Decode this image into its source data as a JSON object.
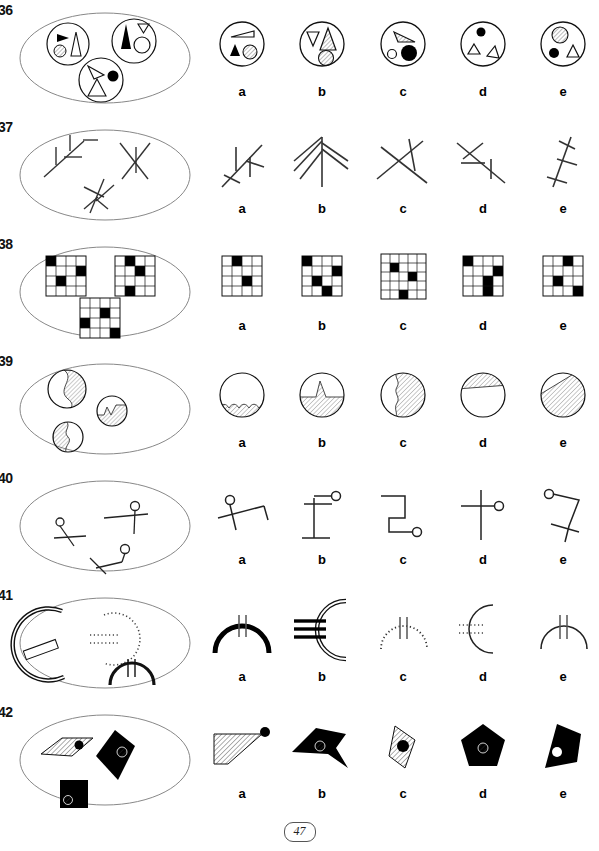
{
  "document": {
    "type": "visual-analogy-puzzle-worksheet",
    "page_number": "47",
    "answer_labels": [
      "a",
      "b",
      "c",
      "d",
      "e"
    ]
  },
  "rows": [
    {
      "number": "36",
      "theme": "circles containing triangles, dots and hatched circles",
      "stem_description": "Oval containing three small circles: (1) black right-pointing triangle, small hatched circle, outlined tall triangle; (2) large black triangle, small outlined down-triangle, outlined circle; (3) outlined slim triangle, black dot, outlined triangle",
      "options": [
        {
          "label": "a",
          "description": "circle with outlined wedge triangle, black triangle and hatched circle"
        },
        {
          "label": "b",
          "description": "circle with outlined down-triangle, hatched tall triangle and hatched circle"
        },
        {
          "label": "c",
          "description": "circle with hatched wedge triangle, small open circle and large black dot"
        },
        {
          "label": "d",
          "description": "circle with black dot and two outlined triangles"
        },
        {
          "label": "e",
          "description": "circle with hatched circle, black dot and outlined triangle"
        }
      ]
    },
    {
      "number": "37",
      "theme": "branching stick figures / arrow-like line clusters",
      "stem_description": "Oval containing three branching line figures resembling arrows and crossed sticks",
      "options": [
        {
          "label": "a",
          "description": "diagonal stem with two upward branches, arrow-like"
        },
        {
          "label": "b",
          "description": "fan of four lines radiating from a single apex, fir-tree like"
        },
        {
          "label": "c",
          "description": "two long lines crossing in an X with a short cross bar"
        },
        {
          "label": "d",
          "description": "diagonal stem with two short left-pointing branches"
        },
        {
          "label": "e",
          "description": "near-vertical stem with three short cross bars"
        }
      ]
    },
    {
      "number": "38",
      "theme": "4x4 grids with black filled cells",
      "stem_description": "Oval containing three 4x4 grids each with three black cells",
      "grid_size": 4,
      "options": [
        {
          "label": "a",
          "filled_cells": [
            [
              0,
              1
            ],
            [
              2,
              2
            ]
          ],
          "description": "4x4 grid, black at row1-col2 and row3-col3"
        },
        {
          "label": "b",
          "filled_cells": [
            [
              0,
              0
            ],
            [
              1,
              3
            ],
            [
              2,
              1
            ],
            [
              3,
              2
            ]
          ],
          "description": "4x4 grid, four black cells in stair pattern"
        },
        {
          "label": "c",
          "filled_cells": [
            [
              1,
              1
            ],
            [
              2,
              2
            ],
            [
              3,
              2
            ]
          ],
          "description": "5x4 grid, black cells in diagonal pattern"
        },
        {
          "label": "d",
          "filled_cells": [
            [
              0,
              0
            ],
            [
              1,
              3
            ],
            [
              2,
              2
            ],
            [
              3,
              2
            ]
          ],
          "description": "4x4 grid, black cells scattered"
        },
        {
          "label": "e",
          "filled_cells": [
            [
              0,
              2
            ],
            [
              2,
              1
            ],
            [
              3,
              3
            ]
          ],
          "description": "4x4 grid, black cells top centre, middle left, bottom right"
        }
      ]
    },
    {
      "number": "39",
      "theme": "circles partly filled with diagonal hatching",
      "stem_description": "Oval containing three circles partly filled with hatched regions bounded by wavy lines",
      "options": [
        {
          "label": "a",
          "description": "circle with small hatched region along the bottom with bumpy top edge"
        },
        {
          "label": "b",
          "description": "circle hatched below a horizontal line with a central peak"
        },
        {
          "label": "c",
          "description": "circle hatched on the right of a jagged vertical boundary"
        },
        {
          "label": "d",
          "description": "circle with thin hatched sliver across the top"
        },
        {
          "label": "e",
          "description": "circle hatched below a diagonal boundary line"
        }
      ]
    },
    {
      "number": "40",
      "theme": "bent lines ending in a small open circle",
      "stem_description": "Oval containing three bent-line figures, each with a small open circle at one end and a crossing stroke",
      "options": [
        {
          "label": "a",
          "description": "bent line rising right, small circle top-left, crossed by a short stroke"
        },
        {
          "label": "b",
          "description": "vertical line with top and bottom cross bars, small circle at upper right"
        },
        {
          "label": "c",
          "description": "stepped zig-zag line with small circle at lower right"
        },
        {
          "label": "d",
          "description": "long vertical line with horizontal cross bar and small circle at right"
        },
        {
          "label": "e",
          "description": "small circle at top left, line bending down and crossed by a stroke"
        }
      ]
    },
    {
      "number": "41",
      "theme": "arcs with short tick marks crossing them",
      "stem_description": "Oval containing an outlined thick left-opening arc with a bar, a dotted arc, and a solid downward arc with two ticks",
      "options": [
        {
          "label": "a",
          "description": "thick solid arc opening downward with two vertical ticks at the top"
        },
        {
          "label": "b",
          "description": "outlined arc opening right with three thick horizontal bars crossing it"
        },
        {
          "label": "c",
          "description": "dotted arc opening downward with two solid vertical ticks"
        },
        {
          "label": "d",
          "description": "thin arc opening right with dotted horizontal ticks crossing it"
        },
        {
          "label": "e",
          "description": "thin solid arc opening downward with two vertical ticks"
        }
      ]
    },
    {
      "number": "42",
      "theme": "polygons, hatched or filled black, each with a contrasting dot",
      "stem_description": "Oval containing a hatched parallelogram with black dot, a black quadrilateral with hatched dot, and a black square with hatched dot",
      "options": [
        {
          "label": "a",
          "description": "hatched trapezium with a black dot at the right apex"
        },
        {
          "label": "b",
          "description": "black arrow-like polygon with a hatched dot"
        },
        {
          "label": "c",
          "description": "hatched narrow quadrilateral with a black dot"
        },
        {
          "label": "d",
          "description": "black pentagon with a hatched dot in the centre"
        },
        {
          "label": "e",
          "description": "black angular polygon with a white dot"
        }
      ]
    }
  ]
}
